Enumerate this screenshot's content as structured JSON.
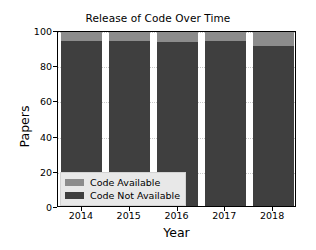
{
  "chart_data": {
    "type": "bar",
    "title": "Release of Code Over Time",
    "xlabel": "Year",
    "ylabel": "Papers",
    "categories": [
      "2014",
      "2015",
      "2016",
      "2017",
      "2018"
    ],
    "series": [
      {
        "name": "Code Not Available",
        "values": [
          94,
          94,
          93,
          94,
          91
        ],
        "color": "#3f3f3f"
      },
      {
        "name": "Code Available",
        "values": [
          6,
          6,
          7,
          6,
          9
        ],
        "color": "#8c8c8c"
      }
    ],
    "stacked": true,
    "ylim": [
      0,
      100
    ],
    "yticks": [
      0,
      20,
      40,
      60,
      80,
      100
    ],
    "ytick_labels": [
      "0",
      "20",
      "40",
      "60",
      "80",
      "100"
    ],
    "grid": true,
    "legend_position": "lower left",
    "legend_entries": [
      "Code Available",
      "Code Not Available"
    ]
  },
  "legend": {
    "available_label": "Code Available",
    "not_available_label": "Code Not Available"
  }
}
